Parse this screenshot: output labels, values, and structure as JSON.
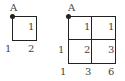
{
  "diagram_left": {
    "corner_label": "A",
    "cell_values": [
      "1"
    ],
    "bottom_left_label": "1",
    "bottom_right_label": "2"
  },
  "diagram_right": {
    "corner_label": "A",
    "cell_values": [
      "1",
      "1",
      "2",
      "3"
    ],
    "left_mid_label": "1",
    "bottom_labels": [
      "1",
      "3",
      "6"
    ]
  }
}
